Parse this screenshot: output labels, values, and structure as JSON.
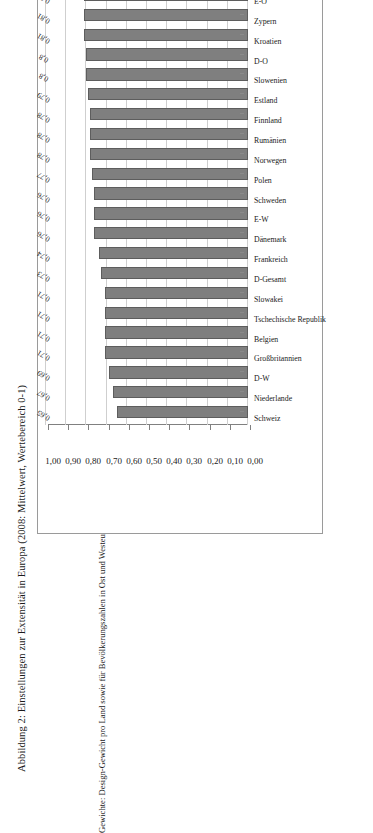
{
  "figure": {
    "title": "Abbildung 2: Einstellungen zur Extensität in Europa (2008: Mittelwert, Wertebereich 0-1)",
    "note": "Gewichte: Design-Gewicht pro Land sowie für Bevölkerungszahlen in Ost und Westeuropa."
  },
  "chart_data": {
    "type": "bar",
    "orientation": "vertical-rotated",
    "title": "Abbildung 2: Einstellungen zur Extensität in Europa (2008: Mittelwert, Wertebereich 0-1)",
    "subtitle": "",
    "xlabel": "",
    "ylabel": "",
    "ylim": [
      0.0,
      1.0
    ],
    "grid": true,
    "legend": null,
    "axis_tick_labels": [
      "0,00",
      "0,10",
      "0,20",
      "0,30",
      "0,40",
      "0,50",
      "0,60",
      "0,70",
      "0,80",
      "0,90",
      "1,00"
    ],
    "axis_tick_values": [
      0.0,
      0.1,
      0.2,
      0.3,
      0.4,
      0.5,
      0.6,
      0.7,
      0.8,
      0.9,
      1.0
    ],
    "decimal_separator": ",",
    "categories": [
      "Schweiz",
      "Niederlande",
      "D-W",
      "Großbritannien",
      "Belgien",
      "Tschechische Republik",
      "Slowakei",
      "D-Gesamt",
      "Frankreich",
      "Dänemark",
      "E-W",
      "Schweden",
      "Polen",
      "Norwegen",
      "Rumänien",
      "Finnland",
      "Estland",
      "Slowenien",
      "D-O",
      "Kroatien",
      "Zypern",
      "E-O",
      "Portugal",
      "Russland",
      "Spanien",
      "Ungarn",
      "Bulgarien",
      "Ukraine",
      "Griechenland",
      "Lettland"
    ],
    "values": [
      0.65,
      0.67,
      0.69,
      0.71,
      0.71,
      0.71,
      0.71,
      0.73,
      0.74,
      0.76,
      0.76,
      0.76,
      0.77,
      0.78,
      0.78,
      0.78,
      0.79,
      0.8,
      0.8,
      0.81,
      0.81,
      0.81,
      0.82,
      0.82,
      0.83,
      0.83,
      0.83,
      0.85,
      0.86,
      0.87
    ],
    "value_labels": [
      "0,65",
      "0,67",
      "0,69",
      "0,71",
      "0,71",
      "0,71",
      "0,71",
      "0,73",
      "0,74",
      "0,76",
      "0,76",
      "0,76",
      "0,77",
      "0,78",
      "0,78",
      "0,78",
      "0,79",
      "0,8",
      "0,8",
      "0,81",
      "0,81",
      "0,81",
      "0,82",
      "0,82",
      "0,83",
      "0,83",
      "0,83",
      "0,85",
      "0,86",
      "0,87"
    ],
    "colors": {
      "bar_fill": "#7f7f7f",
      "bar_stroke": "#5d5d5d",
      "gridline": "#cfcfcf",
      "axis": "#808080",
      "text": "#1a1a1a",
      "frame": "#9a9a9a",
      "background": "#ffffff"
    }
  }
}
